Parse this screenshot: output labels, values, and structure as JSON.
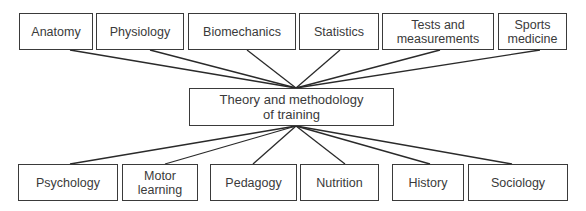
{
  "diagram": {
    "center": {
      "label": "Theory and methodology\nof training",
      "x": 189,
      "y": 88,
      "w": 205,
      "h": 38
    },
    "top_nodes": [
      {
        "label": "Anatomy",
        "x": 19,
        "y": 13,
        "w": 74,
        "h": 37,
        "anchor_x": 70
      },
      {
        "label": "Physiology",
        "x": 96,
        "y": 13,
        "w": 88,
        "h": 37,
        "anchor_x": 150
      },
      {
        "label": "Biomechanics",
        "x": 188,
        "y": 13,
        "w": 108,
        "h": 37,
        "anchor_x": 247
      },
      {
        "label": "Statistics",
        "x": 299,
        "y": 13,
        "w": 80,
        "h": 37,
        "anchor_x": 340
      },
      {
        "label": "Tests and\nmeasurements",
        "x": 382,
        "y": 13,
        "w": 112,
        "h": 37,
        "anchor_x": 440
      },
      {
        "label": "Sports\nmedicine",
        "x": 498,
        "y": 13,
        "w": 69,
        "h": 37,
        "anchor_x": 540
      }
    ],
    "bottom_nodes": [
      {
        "label": "Psychology",
        "x": 18,
        "y": 164,
        "w": 100,
        "h": 37,
        "anchor_x": 70
      },
      {
        "label": "Motor\nlearning",
        "x": 122,
        "y": 164,
        "w": 76,
        "h": 37,
        "anchor_x": 165
      },
      {
        "label": "Pedagogy",
        "x": 210,
        "y": 164,
        "w": 87,
        "h": 37,
        "anchor_x": 253
      },
      {
        "label": "Nutrition",
        "x": 300,
        "y": 164,
        "w": 79,
        "h": 37,
        "anchor_x": 345
      },
      {
        "label": "History",
        "x": 392,
        "y": 164,
        "w": 72,
        "h": 37,
        "anchor_x": 430
      },
      {
        "label": "Sociology",
        "x": 468,
        "y": 164,
        "w": 100,
        "h": 37,
        "anchor_x": 512
      }
    ],
    "hub_top": {
      "x": 296,
      "y": 88
    },
    "hub_bottom": {
      "x": 296,
      "y": 126
    },
    "line_color": "#2a2a2a",
    "border_color": "#3a3a3a"
  }
}
